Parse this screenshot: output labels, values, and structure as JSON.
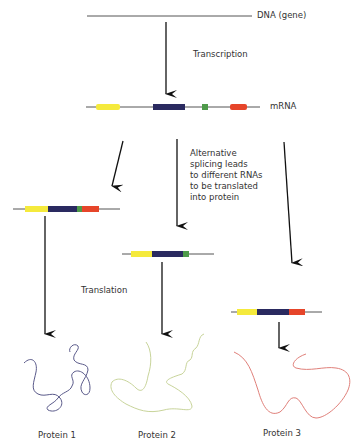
{
  "labels": {
    "dna": "DNA (gene)",
    "transcription": "Transcription",
    "mrna": "mRNA",
    "alt_splicing": "Alternative\nsplicing leads\nto different RNAs\nto be translated\ninto protein",
    "translation": "Translation",
    "protein1": "Protein 1",
    "protein2": "Protein 2",
    "protein3": "Protein 3"
  },
  "colors": {
    "exon1": "#f5ea3c",
    "exon2": "#2a2a60",
    "exon3": "#4e9a4a",
    "exon4": "#e6452a",
    "protein1": "#5a5a8a",
    "protein2": "#c8d49a",
    "protein3": "#e0807a",
    "line": "#555555",
    "arrow": "#111111"
  },
  "transcripts": [
    {
      "name": "full-mrna",
      "exons": [
        "yellow",
        "navy",
        "green",
        "red"
      ]
    },
    {
      "name": "variant-1",
      "exons": [
        "yellow",
        "navy",
        "green",
        "red"
      ]
    },
    {
      "name": "variant-2",
      "exons": [
        "yellow",
        "navy",
        "green"
      ]
    },
    {
      "name": "variant-3",
      "exons": [
        "yellow",
        "navy",
        "red"
      ]
    }
  ]
}
